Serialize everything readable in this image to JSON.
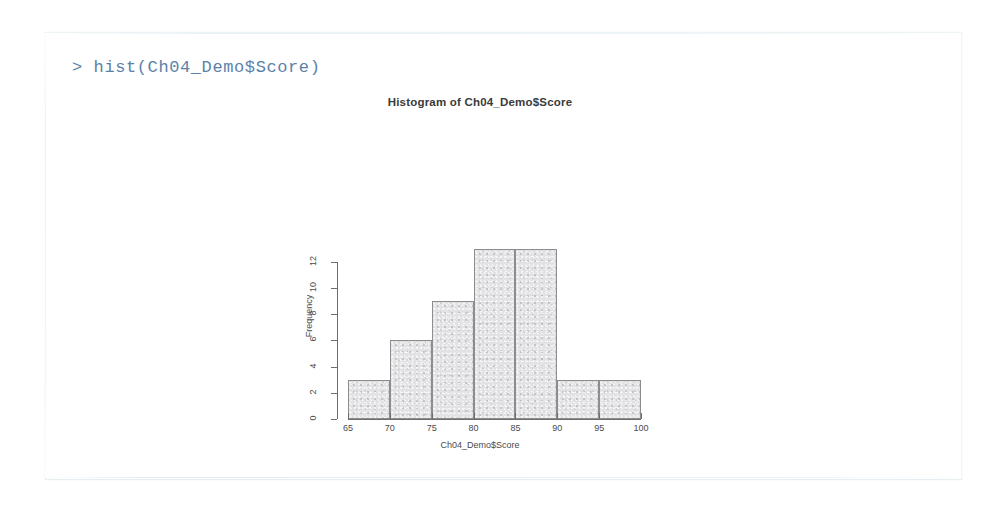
{
  "console": {
    "prompt": ">",
    "command": "> hist(Ch04_Demo$Score)",
    "text_color": "#5c81a8"
  },
  "chart_data": {
    "type": "bar",
    "title": "Histogram of Ch04_Demo$Score",
    "xlabel": "Ch04_Demo$Score",
    "ylabel": "Frequency",
    "categories": [
      "65-70",
      "70-75",
      "75-80",
      "80-85",
      "85-90",
      "90-95",
      "95-100"
    ],
    "bin_edges": [
      65,
      70,
      75,
      80,
      85,
      90,
      95,
      100
    ],
    "values": [
      3,
      6,
      9,
      13,
      13,
      3,
      3
    ],
    "xlim": [
      65,
      100
    ],
    "ylim": [
      0,
      13
    ],
    "xticks": [
      65,
      70,
      75,
      80,
      85,
      90,
      95,
      100
    ],
    "yticks": [
      0,
      2,
      4,
      6,
      8,
      10,
      12
    ],
    "xtick_labels": [
      "65",
      "70",
      "75",
      "80",
      "85",
      "90",
      "95",
      "100"
    ],
    "ytick_labels": [
      "0",
      "2",
      "4",
      "6",
      "8",
      "10",
      "12"
    ],
    "grid": false,
    "legend": null,
    "bar_fill_color": "#e2e2e4",
    "bar_border_color": "#8d8d90"
  }
}
